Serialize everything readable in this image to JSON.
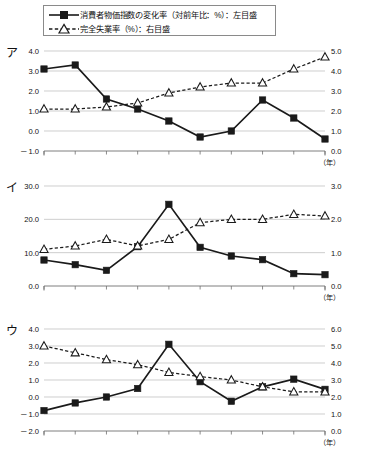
{
  "legend": {
    "items": [
      {
        "marker": "filled-square-solid-line",
        "label": "消費者物価指数の変化率（対前年比：%）：左目盛"
      },
      {
        "marker": "open-triangle-dashed-line",
        "label": "完全失業率（%）：右目盛"
      }
    ]
  },
  "x_unit_label": "（年）",
  "colors": {
    "line": "#1a1a1a",
    "grid": "#b9b9b9",
    "axis": "#6f6f6f",
    "text": "#111111"
  },
  "chart_data": [
    {
      "id": "chart-a",
      "panel_label": "ア",
      "type": "line",
      "title": "",
      "xlabel": "（年）",
      "ylabel": "",
      "grid": true,
      "legend_position": "top",
      "x": [
        1,
        2,
        3,
        4,
        5,
        6,
        7,
        8,
        9,
        10
      ],
      "xtick_labels": [
        "",
        "",
        "",
        "",
        "",
        "",
        "",
        "",
        "",
        ""
      ],
      "left_axis": {
        "name": "消費者物価指数の変化率（対前年比：%）",
        "ylim": [
          -1.0,
          4.0
        ],
        "ticks": [
          4.0,
          3.0,
          2.0,
          1.0,
          0.0,
          -1.0
        ],
        "tick_labels": [
          "4.0",
          "3.0",
          "2.0",
          "1.0",
          "0.0",
          "－1.0"
        ]
      },
      "right_axis": {
        "name": "完全失業率（%）",
        "ylim": [
          0.0,
          5.0
        ],
        "ticks": [
          5.0,
          4.0,
          3.0,
          2.0,
          1.0,
          0.0
        ],
        "tick_labels": [
          "5.0",
          "4.0",
          "3.0",
          "2.0",
          "1.0",
          "0.0"
        ]
      },
      "series": [
        {
          "name": "消費者物価指数の変化率（対前年比：%）：左目盛",
          "axis": "left",
          "marker": "filled-square",
          "linestyle": "solid",
          "values": [
            3.1,
            3.3,
            1.6,
            1.1,
            0.5,
            -0.3,
            0.0,
            1.55,
            0.65,
            -0.4
          ]
        },
        {
          "name": "完全失業率（%）：右目盛",
          "axis": "right",
          "marker": "open-triangle",
          "linestyle": "dashed",
          "values": [
            2.1,
            2.1,
            2.2,
            2.4,
            2.9,
            3.2,
            3.4,
            3.4,
            4.1,
            4.7
          ]
        }
      ]
    },
    {
      "id": "chart-b",
      "panel_label": "イ",
      "type": "line",
      "title": "",
      "xlabel": "（年）",
      "ylabel": "",
      "grid": true,
      "legend_position": "top",
      "x": [
        1,
        2,
        3,
        4,
        5,
        6,
        7,
        8,
        9,
        10
      ],
      "xtick_labels": [
        "",
        "",
        "",
        "",
        "",
        "",
        "",
        "",
        "",
        ""
      ],
      "left_axis": {
        "name": "消費者物価指数の変化率（対前年比：%）",
        "ylim": [
          0.0,
          30.0
        ],
        "ticks": [
          30.0,
          20.0,
          10.0,
          0.0
        ],
        "tick_labels": [
          "30.0",
          "20.0",
          "10.0",
          "0.0"
        ]
      },
      "right_axis": {
        "name": "完全失業率（%）",
        "ylim": [
          0.0,
          3.0
        ],
        "ticks": [
          3.0,
          2.0,
          1.0,
          0.0
        ],
        "tick_labels": [
          "3.0",
          "2.0",
          "1.0",
          "0.0"
        ]
      },
      "series": [
        {
          "name": "消費者物価指数の変化率（対前年比：%）：左目盛",
          "axis": "left",
          "marker": "filled-square",
          "linestyle": "solid",
          "values": [
            7.8,
            6.4,
            4.7,
            11.8,
            24.5,
            11.6,
            9.0,
            7.9,
            3.7,
            3.4
          ]
        },
        {
          "name": "完全失業率（%）：右目盛",
          "axis": "right",
          "marker": "open-triangle",
          "linestyle": "dashed",
          "values": [
            1.1,
            1.2,
            1.4,
            1.2,
            1.4,
            1.9,
            2.0,
            2.0,
            2.15,
            2.1
          ]
        }
      ]
    },
    {
      "id": "chart-c",
      "panel_label": "ウ",
      "type": "line",
      "title": "",
      "xlabel": "（年）",
      "ylabel": "",
      "grid": true,
      "legend_position": "top",
      "x": [
        1,
        2,
        3,
        4,
        5,
        6,
        7,
        8,
        9,
        10
      ],
      "xtick_labels": [
        "",
        "",
        "",
        "",
        "",
        "",
        "",
        "",
        "",
        ""
      ],
      "left_axis": {
        "name": "消費者物価指数の変化率（対前年比：%）",
        "ylim": [
          -2.0,
          4.0
        ],
        "ticks": [
          4.0,
          3.0,
          2.0,
          1.0,
          0.0,
          -1.0,
          -2.0
        ],
        "tick_labels": [
          "4.0",
          "3.0",
          "2.0",
          "1.0",
          "0.0",
          "－1.0",
          "－2.0"
        ]
      },
      "right_axis": {
        "name": "完全失業率（%）",
        "ylim": [
          0.0,
          6.0
        ],
        "ticks": [
          6.0,
          5.0,
          4.0,
          3.0,
          2.0,
          1.0,
          0.0
        ],
        "tick_labels": [
          "6.0",
          "5.0",
          "4.0",
          "3.0",
          "2.0",
          "1.0",
          "0.0"
        ]
      },
      "series": [
        {
          "name": "消費者物価指数の変化率（対前年比：%）：左目盛",
          "axis": "left",
          "marker": "filled-square",
          "linestyle": "solid",
          "values": [
            -0.8,
            -0.35,
            0.0,
            0.5,
            3.1,
            0.9,
            -0.25,
            0.6,
            1.05,
            0.45
          ]
        },
        {
          "name": "完全失業率（%）：右目盛",
          "axis": "right",
          "marker": "open-triangle",
          "linestyle": "dashed",
          "values": [
            5.0,
            4.6,
            4.2,
            3.9,
            3.45,
            3.2,
            3.0,
            2.6,
            2.3,
            2.3
          ]
        }
      ]
    }
  ]
}
